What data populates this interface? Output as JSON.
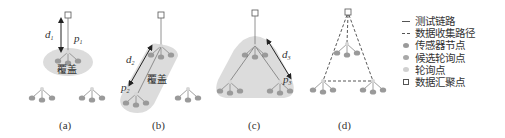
{
  "panels": [
    {
      "id": "a",
      "label": "(a)",
      "distance_label": "d",
      "distance_sub": "1",
      "point_label": "p",
      "point_sub": "1",
      "coverage_label": "覆盖"
    },
    {
      "id": "b",
      "label": "(b)",
      "distance_label": "d",
      "distance_sub": "2",
      "point_label": "p",
      "point_sub": "2",
      "coverage_label": "覆盖"
    },
    {
      "id": "c",
      "label": "(c)",
      "distance_label": "d",
      "distance_sub": "3",
      "point_label": "p",
      "point_sub": "3"
    },
    {
      "id": "d",
      "label": "(d)"
    }
  ],
  "legend": {
    "items": [
      {
        "symbol": "solid-line",
        "label": "测试链路"
      },
      {
        "symbol": "dashed-line",
        "label": "数据收集路径"
      },
      {
        "symbol": "dot",
        "color": "#9a9a9a",
        "label": "传感器节点"
      },
      {
        "symbol": "dot",
        "color": "#a8a8a8",
        "label": "候选轮询点"
      },
      {
        "symbol": "dot",
        "color": "#d0d0d0",
        "label": "轮询点"
      },
      {
        "symbol": "square",
        "label": "数据汇聚点"
      }
    ]
  },
  "colors": {
    "coverage_fill": "#dcdcdc",
    "sensor_node": "#9a9a9a",
    "line": "#777777",
    "text": "#333333"
  }
}
